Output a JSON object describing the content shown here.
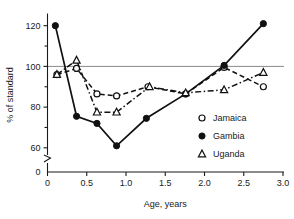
{
  "chart_data": {
    "type": "line",
    "title": "",
    "xlabel": "Age, years",
    "ylabel": "% of standard",
    "xlim": [
      0,
      3.0
    ],
    "ylim": [
      55,
      125
    ],
    "grid": false,
    "reference_line": {
      "y": 100,
      "label": "100% of standard"
    },
    "axis_break": true,
    "xticks": [
      "0",
      "0.5",
      "1.0",
      "1.5",
      "2.0",
      "2.5",
      "3.0"
    ],
    "xtick_values": [
      0,
      0.5,
      1.0,
      1.5,
      2.0,
      2.5,
      3.0
    ],
    "yticks": [
      "0",
      "60",
      "80",
      "100",
      "120"
    ],
    "ytick_values": [
      0,
      60,
      80,
      100,
      120
    ],
    "yminor_values": [
      70,
      90,
      110
    ],
    "legend_position": "right-middle",
    "series": [
      {
        "name": "Jamaica",
        "marker": "open-circle",
        "line_style": "dashed",
        "x": [
          0.12,
          0.37,
          0.63,
          0.88,
          1.28,
          1.76,
          2.25,
          2.75
        ],
        "values": [
          96,
          99,
          86.5,
          85.5,
          90,
          86.5,
          99.5,
          90
        ]
      },
      {
        "name": "Gambia",
        "marker": "filled-circle",
        "line_style": "solid",
        "x": [
          0.1,
          0.37,
          0.63,
          0.88,
          1.26,
          1.76,
          2.25,
          2.75
        ],
        "values": [
          120,
          75.5,
          72,
          61,
          74.5,
          86.5,
          100.5,
          121
        ]
      },
      {
        "name": "Uganda",
        "marker": "open-triangle",
        "line_style": "dash-dot",
        "x": [
          0.12,
          0.37,
          0.63,
          0.88,
          1.3,
          1.76,
          2.25,
          2.75
        ],
        "values": [
          96,
          103,
          77.5,
          77.5,
          90,
          87,
          88.5,
          97
        ]
      }
    ]
  },
  "legend": {
    "items": [
      {
        "label": "Jamaica",
        "marker": "open-circle"
      },
      {
        "label": "Gambia",
        "marker": "filled-circle"
      },
      {
        "label": "Uganda",
        "marker": "open-triangle"
      }
    ]
  }
}
